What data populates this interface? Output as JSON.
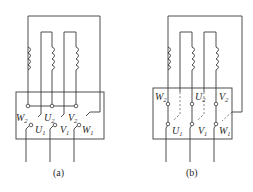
{
  "figure": {
    "panels": [
      {
        "id": "a",
        "caption": "(a)",
        "connection": "star (Y)",
        "top_terminals": [
          {
            "name": "W",
            "sub": "2"
          },
          {
            "name": "U",
            "sub": "2"
          },
          {
            "name": "V",
            "sub": "2"
          }
        ],
        "bottom_terminals": [
          {
            "name": "U",
            "sub": "1"
          },
          {
            "name": "V",
            "sub": "1"
          },
          {
            "name": "W",
            "sub": "1"
          }
        ]
      },
      {
        "id": "b",
        "caption": "(b)",
        "connection": "delta (Δ)",
        "top_terminals": [
          {
            "name": "W",
            "sub": "2"
          },
          {
            "name": "U",
            "sub": "2"
          },
          {
            "name": "V",
            "sub": "2"
          }
        ],
        "bottom_terminals": [
          {
            "name": "U",
            "sub": "1"
          },
          {
            "name": "V",
            "sub": "1"
          },
          {
            "name": "W",
            "sub": "1"
          }
        ]
      }
    ],
    "colors": {
      "line": "#3a3a3a",
      "background": "#ffffff"
    }
  }
}
